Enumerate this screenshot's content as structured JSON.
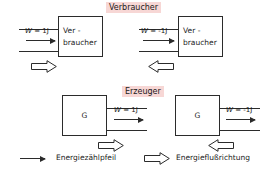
{
  "figure": {
    "line_color": "#2b2b2b",
    "caption_bg": "#f7d7d5"
  },
  "sections": {
    "consumer": {
      "caption": "Verbraucher",
      "cases": [
        {
          "id": "consumer-positive",
          "box_line1": "Ver -",
          "box_line2": "braucher",
          "w_label_prefix": "W = ",
          "w_label_value": "1J",
          "count_arrow_direction": "right",
          "flow_arrow_direction": "right"
        },
        {
          "id": "consumer-negative",
          "box_line1": "Ver -",
          "box_line2": "braucher",
          "w_label_prefix": "W = ",
          "w_label_value": "-1J",
          "count_arrow_direction": "right",
          "flow_arrow_direction": "left"
        }
      ]
    },
    "generator": {
      "caption": "Erzeuger",
      "cases": [
        {
          "id": "generator-positive",
          "box_symbol": "G",
          "w_label_prefix": "W = ",
          "w_label_value": "1J",
          "count_arrow_direction": "right",
          "flow_arrow_direction": "right"
        },
        {
          "id": "generator-negative",
          "box_symbol": "G",
          "w_label_prefix": "W = ",
          "w_label_value": "-1J",
          "count_arrow_direction": "right",
          "flow_arrow_direction": "left"
        }
      ]
    }
  },
  "legend": {
    "items": [
      {
        "icon": "thin-arrow-right-icon",
        "label": "Energiezählpfeil"
      },
      {
        "icon": "hollow-block-arrow-right-icon",
        "label": "Energieflußrichtung"
      }
    ]
  }
}
